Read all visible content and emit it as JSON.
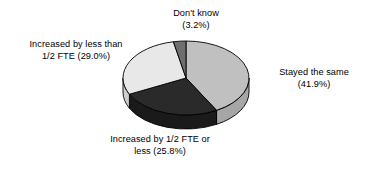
{
  "chart_data": {
    "type": "pie",
    "title": "",
    "subtitle": "",
    "xlabel": "",
    "ylabel": "",
    "three_d": true,
    "grid": false,
    "legend_position": "none",
    "label_format": "{name} ({value}%)",
    "units": "percent",
    "total": 99.9,
    "start_angle_deg": 0,
    "direction": "clockwise",
    "categories": [
      "Stayed the same",
      "Increased by 1/2 FTE or less",
      "Increased by less than 1/2 FTE",
      "Don't know"
    ],
    "values": [
      41.9,
      25.8,
      29.0,
      3.2
    ],
    "colors": [
      "#c0c0c0",
      "#2a2a2a",
      "#e8e8e8",
      "#6e6e6e"
    ],
    "slices": [
      {
        "name": "Stayed the same",
        "value": 41.9,
        "value_text": "41.9%",
        "label_text": "Stayed the same",
        "percent_text": "(41.9%)",
        "color": "#c0c0c0",
        "side_color": "#a6a6a6",
        "start_angle_deg": 0,
        "end_angle_deg": 150.8
      },
      {
        "name": "Increased by 1/2 FTE or less",
        "value": 25.8,
        "value_text": "25.8%",
        "label_line1": "Increased by 1/2 FTE or",
        "label_line2": "less (25.8%)",
        "color": "#2a2a2a",
        "side_color": "#1a1a1a",
        "start_angle_deg": 150.8,
        "end_angle_deg": 243.7
      },
      {
        "name": "Increased by less than 1/2 FTE",
        "value": 29.0,
        "value_text": "29.0%",
        "label_line1": "Increased by less than",
        "label_line2": "1/2 FTE (29.0%)",
        "color": "#e8e8e8",
        "side_color": "#cfcfcf",
        "start_angle_deg": 243.7,
        "end_angle_deg": 348.2
      },
      {
        "name": "Don't know",
        "value": 3.2,
        "value_text": "3.2%",
        "label_line1": "Don't know",
        "label_line2": "(3.2%)",
        "color": "#6e6e6e",
        "side_color": "#565656",
        "start_angle_deg": 348.2,
        "end_angle_deg": 360
      }
    ]
  },
  "labels": {
    "dont_know": {
      "line1": "Don't know",
      "line2": "(3.2%)"
    },
    "increased_less_than": {
      "line1": "Increased by less than",
      "line2": "1/2 FTE (29.0%)"
    },
    "stayed_same": {
      "line1": "Stayed the same",
      "line2": "(41.9%)"
    },
    "increased_half_or_less": {
      "line1": "Increased by 1/2 FTE or",
      "line2": "less (25.8%)"
    }
  },
  "style": {
    "background": "#ffffff",
    "text_color": "#000000",
    "outline_color": "#000000"
  }
}
